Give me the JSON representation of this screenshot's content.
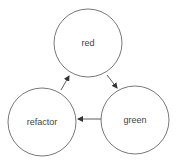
{
  "diagram": {
    "type": "cycle",
    "nodes": [
      {
        "id": "red",
        "label": "red",
        "cx": 88,
        "cy": 43,
        "r": 34
      },
      {
        "id": "green",
        "label": "green",
        "cx": 135,
        "cy": 120,
        "r": 34
      },
      {
        "id": "refactor",
        "label": "refactor",
        "cx": 42,
        "cy": 122,
        "r": 34
      }
    ],
    "edges": [
      {
        "from": "red",
        "to": "green"
      },
      {
        "from": "green",
        "to": "refactor"
      },
      {
        "from": "refactor",
        "to": "red"
      }
    ],
    "colors": {
      "stroke": "#555555",
      "text": "#444444",
      "background": "#ffffff"
    }
  }
}
